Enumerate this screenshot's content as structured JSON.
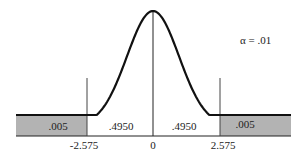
{
  "diagram": {
    "type": "normal-distribution",
    "alpha_label": "α = .01",
    "regions": [
      {
        "id": "left-tail",
        "value": ".005",
        "shaded": true
      },
      {
        "id": "left-center",
        "value": ".4950",
        "shaded": false
      },
      {
        "id": "right-center",
        "value": ".4950",
        "shaded": false
      },
      {
        "id": "right-tail",
        "value": ".005",
        "shaded": true
      }
    ],
    "axis_ticks": [
      "-2.575",
      "0",
      "2.575"
    ],
    "colors": {
      "shade": "#b3b3b3",
      "curve": "#111111"
    }
  }
}
